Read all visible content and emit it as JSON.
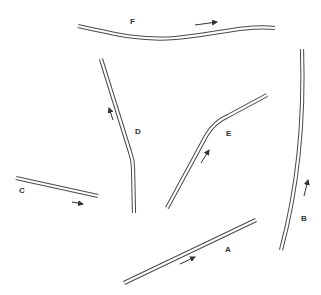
{
  "diagram": {
    "type": "tubes-with-flow-arrows",
    "tubes": [
      {
        "id": "A",
        "label": "A",
        "shape": "straight",
        "direction": "right-up"
      },
      {
        "id": "B",
        "label": "B",
        "shape": "slightly curved",
        "direction": "up"
      },
      {
        "id": "C",
        "label": "C",
        "shape": "straight",
        "direction": "right-down"
      },
      {
        "id": "D",
        "label": "D",
        "shape": "bent",
        "direction": "up"
      },
      {
        "id": "E",
        "label": "E",
        "shape": "bent",
        "direction": "up-right"
      },
      {
        "id": "F",
        "label": "F",
        "shape": "wavy",
        "direction": "right"
      }
    ],
    "colors": {
      "stroke": "#4a4a4a",
      "background": "#ffffff"
    }
  }
}
